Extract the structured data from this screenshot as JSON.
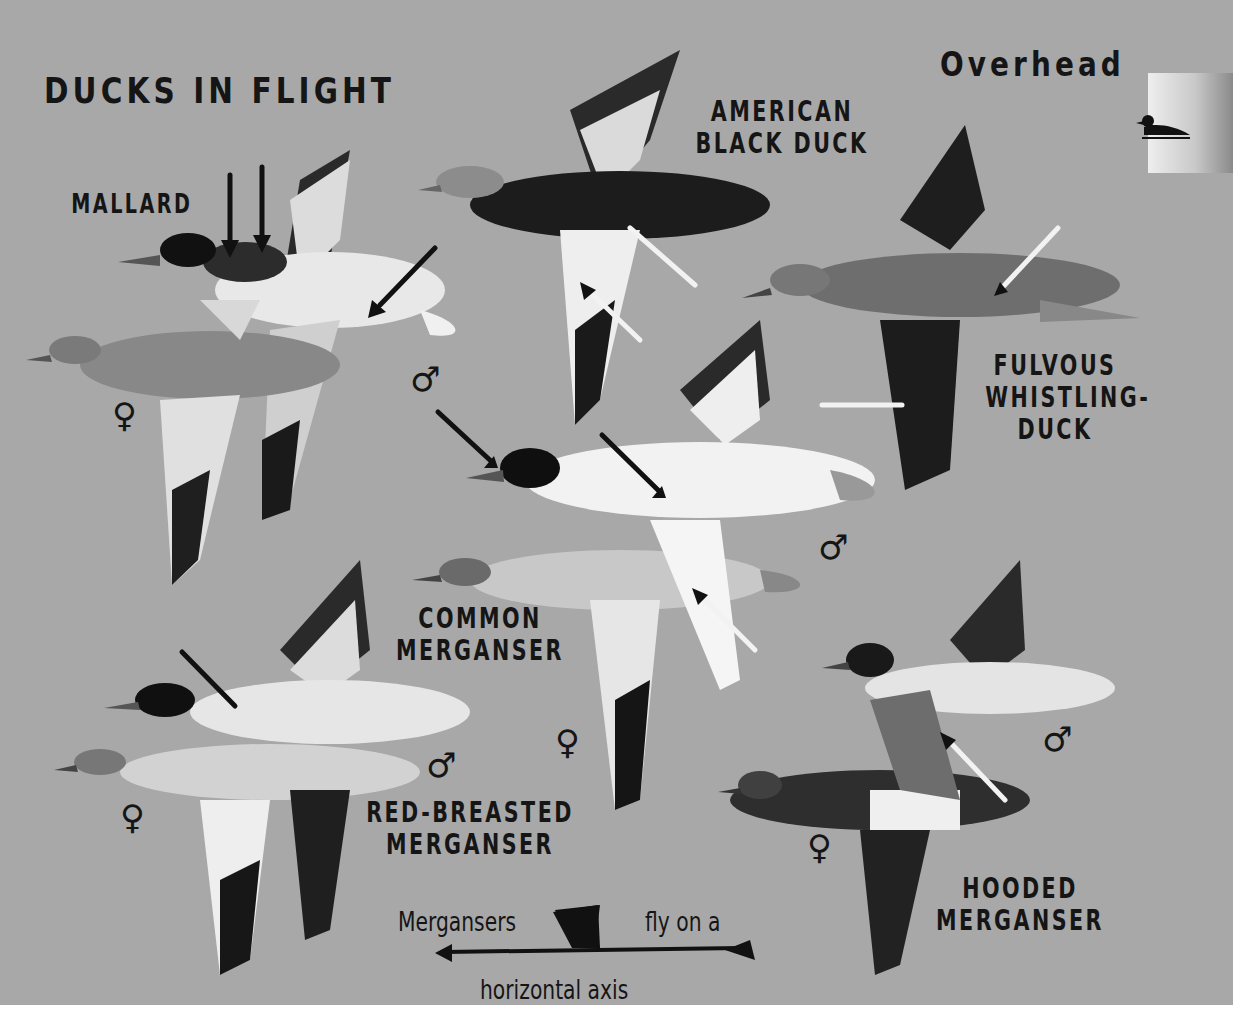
{
  "page": {
    "title": "DUCKS IN FLIGHT",
    "view_label": "Overhead",
    "tab_icon": "duck-silhouette-icon",
    "background": "#a8a8a8"
  },
  "species": [
    {
      "id": "mallard",
      "label": "MALLARD",
      "sexes": [
        "male",
        "female"
      ]
    },
    {
      "id": "american-black-duck",
      "label_lines": [
        "AMERICAN",
        "BLACK DUCK"
      ]
    },
    {
      "id": "fulvous-whistling-duck",
      "label_lines": [
        "FULVOUS",
        "WHISTLING-",
        "DUCK"
      ]
    },
    {
      "id": "common-merganser",
      "label_lines": [
        "COMMON",
        "MERGANSER"
      ],
      "sexes": [
        "male",
        "female"
      ]
    },
    {
      "id": "red-breasted-merganser",
      "label_lines": [
        "RED-BREASTED",
        "MERGANSER"
      ],
      "sexes": [
        "male",
        "female"
      ]
    },
    {
      "id": "hooded-merganser",
      "label_lines": [
        "HOODED",
        "MERGANSER"
      ],
      "sexes": [
        "male",
        "female"
      ]
    }
  ],
  "symbols": {
    "male": "♂",
    "female": "♀"
  },
  "note": {
    "part1": "Mergansers",
    "part2": "fly on a",
    "part3": "horizontal axis"
  }
}
